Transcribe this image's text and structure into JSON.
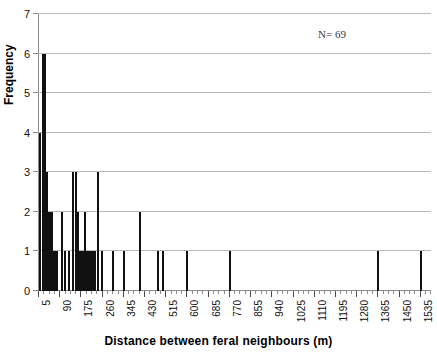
{
  "chart_data": {
    "type": "bar",
    "title": "",
    "xlabel": "Distance between feral neighbours (m)",
    "ylabel": "Frequency",
    "annotation": "N= 69",
    "sample_size": 69,
    "ylim": [
      0,
      7
    ],
    "yticks": [
      0,
      1,
      2,
      3,
      4,
      5,
      6,
      7
    ],
    "xlim": [
      5,
      1580
    ],
    "xticks": [
      5,
      90,
      175,
      260,
      345,
      430,
      515,
      600,
      685,
      770,
      855,
      940,
      1025,
      1110,
      1195,
      1280,
      1365,
      1450,
      1535
    ],
    "xtick_step": 85,
    "minor_ticks_per_major": 4,
    "grid": "horizontal",
    "legend": "none",
    "bar_color": "#111111",
    "gridline_color": "#b9b9b9",
    "categories": [
      10,
      22,
      30,
      38,
      46,
      52,
      58,
      64,
      70,
      78,
      96,
      110,
      124,
      140,
      152,
      160,
      168,
      175,
      182,
      190,
      198,
      206,
      214,
      222,
      230,
      240,
      258,
      270,
      285,
      300,
      318,
      330,
      345,
      360,
      375,
      392,
      410,
      428,
      446,
      462,
      478,
      496,
      512,
      530,
      548,
      566,
      584,
      600,
      618,
      636,
      654,
      672,
      690,
      708,
      726,
      744,
      762,
      770,
      790,
      1365,
      1535
    ],
    "values": [
      4,
      6,
      6,
      3,
      2,
      2,
      2,
      1,
      1,
      1,
      2,
      1,
      1,
      3,
      3,
      2,
      1,
      1,
      1,
      2,
      1,
      1,
      1,
      1,
      1,
      3,
      1,
      1,
      1,
      1,
      1,
      1,
      1,
      1,
      1,
      1,
      2,
      1,
      1,
      1,
      1,
      1,
      1,
      1,
      1,
      1,
      1,
      1,
      1,
      1,
      1,
      1,
      1,
      1,
      1,
      1,
      1,
      1,
      1,
      1,
      1
    ],
    "bars": [
      {
        "x": 10,
        "y": 4
      },
      {
        "x": 22,
        "y": 6
      },
      {
        "x": 30,
        "y": 6
      },
      {
        "x": 38,
        "y": 3
      },
      {
        "x": 46,
        "y": 2
      },
      {
        "x": 52,
        "y": 2
      },
      {
        "x": 58,
        "y": 2
      },
      {
        "x": 64,
        "y": 1
      },
      {
        "x": 70,
        "y": 1
      },
      {
        "x": 78,
        "y": 1
      },
      {
        "x": 96,
        "y": 2
      },
      {
        "x": 110,
        "y": 1
      },
      {
        "x": 124,
        "y": 1
      },
      {
        "x": 140,
        "y": 3
      },
      {
        "x": 152,
        "y": 3
      },
      {
        "x": 160,
        "y": 2
      },
      {
        "x": 168,
        "y": 1
      },
      {
        "x": 175,
        "y": 1
      },
      {
        "x": 182,
        "y": 1
      },
      {
        "x": 190,
        "y": 2
      },
      {
        "x": 198,
        "y": 1
      },
      {
        "x": 206,
        "y": 1
      },
      {
        "x": 214,
        "y": 1
      },
      {
        "x": 222,
        "y": 1
      },
      {
        "x": 230,
        "y": 1
      },
      {
        "x": 240,
        "y": 3
      },
      {
        "x": 258,
        "y": 1
      },
      {
        "x": 300,
        "y": 1
      },
      {
        "x": 345,
        "y": 1
      },
      {
        "x": 410,
        "y": 2
      },
      {
        "x": 480,
        "y": 1
      },
      {
        "x": 500,
        "y": 1
      },
      {
        "x": 600,
        "y": 1
      },
      {
        "x": 770,
        "y": 1
      },
      {
        "x": 1365,
        "y": 1
      },
      {
        "x": 1535,
        "y": 1
      }
    ]
  }
}
